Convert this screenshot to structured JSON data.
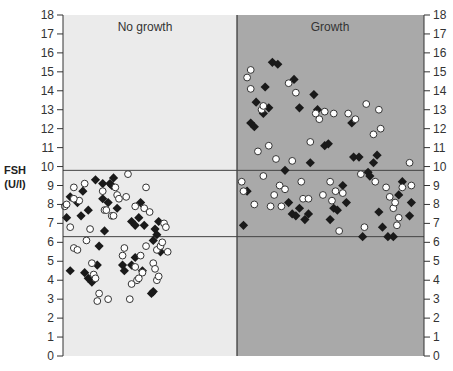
{
  "chart_data": {
    "type": "scatter",
    "title": "",
    "xlabel": "",
    "ylabel": "FSH (U/l)",
    "ylabel_lines": [
      "FSH",
      "(U/l)"
    ],
    "ylim": [
      0,
      18
    ],
    "yticks": [
      0,
      1,
      2,
      3,
      4,
      5,
      6,
      7,
      8,
      9,
      10,
      11,
      12,
      13,
      14,
      15,
      16,
      17,
      18
    ],
    "y_axis_left": true,
    "y_axis_right": true,
    "grid": false,
    "legend": null,
    "reference_lines": [
      {
        "orientation": "horizontal",
        "y": 9.8,
        "span": "full"
      },
      {
        "orientation": "horizontal",
        "y": 6.3,
        "span": "full"
      }
    ],
    "panels": [
      {
        "name": "No growth",
        "x_range": [
          0,
          0.482
        ],
        "background": "#ebebeb"
      },
      {
        "name": "Growth",
        "x_range": [
          0.482,
          1.0
        ],
        "background": "#a9a9a9"
      }
    ],
    "series": [
      {
        "name": "filled diamonds",
        "marker": "diamond",
        "fill": "#1a1a1a",
        "panel_points": {
          "No growth": [
            [
              0.01,
              7.3
            ],
            [
              0.02,
              8.4
            ],
            [
              0.02,
              4.5
            ],
            [
              0.04,
              8.1
            ],
            [
              0.05,
              7.4
            ],
            [
              0.055,
              8.7
            ],
            [
              0.07,
              4.1
            ],
            [
              0.07,
              7.7
            ],
            [
              0.08,
              3.9
            ],
            [
              0.09,
              9.3
            ],
            [
              0.095,
              4.8
            ],
            [
              0.1,
              5.8
            ],
            [
              0.11,
              9.1
            ],
            [
              0.11,
              8.3
            ],
            [
              0.115,
              6.6
            ],
            [
              0.125,
              8.1
            ],
            [
              0.13,
              9.1
            ],
            [
              0.135,
              9.0
            ],
            [
              0.14,
              9.4
            ],
            [
              0.15,
              7.8
            ],
            [
              0.165,
              4.8
            ],
            [
              0.17,
              4.5
            ],
            [
              0.19,
              4.8
            ],
            [
              0.19,
              7.1
            ],
            [
              0.2,
              5.2
            ],
            [
              0.2,
              6.9
            ],
            [
              0.21,
              7.3
            ],
            [
              0.215,
              8.1
            ],
            [
              0.225,
              6.9
            ],
            [
              0.245,
              3.3
            ],
            [
              0.25,
              3.4
            ],
            [
              0.25,
              6.1
            ],
            [
              0.255,
              6.7
            ],
            [
              0.26,
              6.4
            ],
            [
              0.265,
              7.1
            ],
            [
              0.27,
              5.5
            ],
            [
              0.22,
              4.5
            ],
            [
              0.06,
              4.4
            ]
          ],
          "Growth": [
            [
              0.5,
              6.9
            ],
            [
              0.51,
              8.7
            ],
            [
              0.52,
              12.3
            ],
            [
              0.53,
              12.1
            ],
            [
              0.535,
              13.4
            ],
            [
              0.555,
              12.8
            ],
            [
              0.56,
              14.2
            ],
            [
              0.57,
              13.1
            ],
            [
              0.58,
              15.5
            ],
            [
              0.595,
              15.4
            ],
            [
              0.615,
              9.8
            ],
            [
              0.625,
              8.1
            ],
            [
              0.635,
              7.5
            ],
            [
              0.64,
              14.6
            ],
            [
              0.645,
              7.4
            ],
            [
              0.655,
              13.1
            ],
            [
              0.655,
              7.8
            ],
            [
              0.67,
              7.2
            ],
            [
              0.68,
              7.5
            ],
            [
              0.685,
              10.2
            ],
            [
              0.695,
              13.8
            ],
            [
              0.705,
              13.0
            ],
            [
              0.725,
              11.1
            ],
            [
              0.735,
              11.2
            ],
            [
              0.74,
              7.2
            ],
            [
              0.75,
              7.8
            ],
            [
              0.76,
              7.7
            ],
            [
              0.775,
              9.0
            ],
            [
              0.785,
              8.1
            ],
            [
              0.8,
              12.3
            ],
            [
              0.805,
              10.5
            ],
            [
              0.82,
              10.5
            ],
            [
              0.83,
              6.3
            ],
            [
              0.845,
              9.7
            ],
            [
              0.85,
              9.5
            ],
            [
              0.86,
              10.2
            ],
            [
              0.87,
              10.6
            ],
            [
              0.875,
              7.6
            ],
            [
              0.885,
              6.8
            ],
            [
              0.9,
              6.3
            ],
            [
              0.915,
              6.3
            ],
            [
              0.93,
              8.5
            ],
            [
              0.94,
              9.2
            ],
            [
              0.96,
              7.4
            ],
            [
              0.965,
              8.1
            ]
          ]
        }
      },
      {
        "name": "open circles",
        "marker": "circle",
        "fill": "#ffffff",
        "panel_points": {
          "No growth": [
            [
              0.005,
              7.9
            ],
            [
              0.01,
              8.0
            ],
            [
              0.02,
              6.8
            ],
            [
              0.03,
              8.9
            ],
            [
              0.03,
              5.7
            ],
            [
              0.04,
              5.6
            ],
            [
              0.045,
              8.2
            ],
            [
              0.06,
              9.1
            ],
            [
              0.065,
              6.1
            ],
            [
              0.075,
              6.7
            ],
            [
              0.08,
              4.9
            ],
            [
              0.085,
              4.3
            ],
            [
              0.09,
              4.1
            ],
            [
              0.095,
              2.9
            ],
            [
              0.1,
              3.3
            ],
            [
              0.11,
              8.7
            ],
            [
              0.115,
              7.7
            ],
            [
              0.12,
              7.7
            ],
            [
              0.125,
              3.0
            ],
            [
              0.135,
              7.4
            ],
            [
              0.14,
              7.4
            ],
            [
              0.145,
              8.9
            ],
            [
              0.15,
              8.5
            ],
            [
              0.155,
              8.3
            ],
            [
              0.165,
              5.3
            ],
            [
              0.17,
              5.7
            ],
            [
              0.175,
              8.4
            ],
            [
              0.18,
              9.6
            ],
            [
              0.185,
              3.0
            ],
            [
              0.19,
              3.8
            ],
            [
              0.2,
              4.7
            ],
            [
              0.2,
              7.9
            ],
            [
              0.205,
              4.0
            ],
            [
              0.21,
              4.1
            ],
            [
              0.215,
              5.3
            ],
            [
              0.22,
              4.4
            ],
            [
              0.225,
              7.8
            ],
            [
              0.23,
              8.9
            ],
            [
              0.23,
              5.8
            ],
            [
              0.24,
              7.6
            ],
            [
              0.25,
              4.9
            ],
            [
              0.255,
              4.6
            ],
            [
              0.26,
              5.6
            ],
            [
              0.26,
              4.0
            ],
            [
              0.265,
              4.2
            ],
            [
              0.27,
              5.8
            ],
            [
              0.275,
              6.0
            ],
            [
              0.28,
              7.0
            ],
            [
              0.285,
              6.8
            ],
            [
              0.29,
              5.5
            ],
            [
              0.03,
              8.3
            ]
          ],
          "Growth": [
            [
              0.495,
              9.2
            ],
            [
              0.5,
              8.7
            ],
            [
              0.51,
              14.7
            ],
            [
              0.52,
              14.1
            ],
            [
              0.52,
              15.1
            ],
            [
              0.53,
              8.0
            ],
            [
              0.54,
              10.8
            ],
            [
              0.55,
              13.0
            ],
            [
              0.555,
              13.2
            ],
            [
              0.555,
              9.5
            ],
            [
              0.57,
              11.1
            ],
            [
              0.575,
              7.9
            ],
            [
              0.585,
              8.5
            ],
            [
              0.59,
              10.4
            ],
            [
              0.6,
              9.0
            ],
            [
              0.605,
              7.9
            ],
            [
              0.615,
              8.8
            ],
            [
              0.625,
              14.4
            ],
            [
              0.635,
              10.3
            ],
            [
              0.645,
              13.9
            ],
            [
              0.66,
              9.2
            ],
            [
              0.665,
              8.3
            ],
            [
              0.68,
              8.3
            ],
            [
              0.685,
              11.3
            ],
            [
              0.7,
              12.8
            ],
            [
              0.71,
              12.5
            ],
            [
              0.72,
              8.5
            ],
            [
              0.725,
              12.9
            ],
            [
              0.74,
              9.2
            ],
            [
              0.745,
              8.2
            ],
            [
              0.75,
              12.8
            ],
            [
              0.755,
              8.7
            ],
            [
              0.765,
              6.6
            ],
            [
              0.775,
              8.6
            ],
            [
              0.79,
              12.8
            ],
            [
              0.81,
              12.5
            ],
            [
              0.825,
              9.6
            ],
            [
              0.835,
              6.8
            ],
            [
              0.84,
              13.3
            ],
            [
              0.86,
              11.7
            ],
            [
              0.865,
              9.2
            ],
            [
              0.875,
              13.0
            ],
            [
              0.88,
              12.0
            ],
            [
              0.895,
              8.9
            ],
            [
              0.905,
              8.4
            ],
            [
              0.915,
              7.8
            ],
            [
              0.92,
              8.1
            ],
            [
              0.925,
              6.9
            ],
            [
              0.93,
              7.3
            ],
            [
              0.94,
              8.9
            ],
            [
              0.96,
              10.2
            ],
            [
              0.965,
              9.0
            ]
          ]
        }
      }
    ],
    "plot_pixels": {
      "left": 63,
      "right": 424,
      "top": 15,
      "bottom": 356,
      "divider_x": 237
    }
  },
  "labels": {
    "panel_left": "No growth",
    "panel_right": "Growth",
    "ylabel_line1": "FSH",
    "ylabel_line2": "(U/l)"
  },
  "colors": {
    "panel_left_bg": "#ebebeb",
    "panel_right_bg": "#a9a9a9",
    "axis": "#333333",
    "marker_filled": "#1a1a1a",
    "marker_open_fill": "#ffffff",
    "marker_open_stroke": "#333333"
  }
}
